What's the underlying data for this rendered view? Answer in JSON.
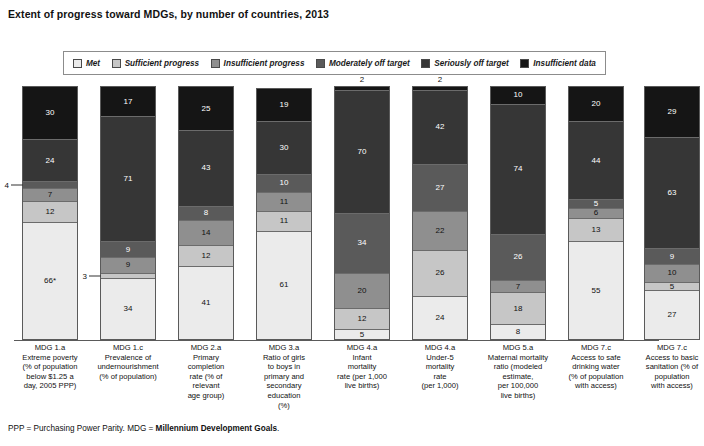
{
  "title": "Extent of progress toward MDGs, by number of countries, 2013",
  "footnote": {
    "prefix": "PPP = Purchasing Power Parity. MDG = ",
    "bold": "Millennium Development Goals",
    "suffix": "."
  },
  "legend": {
    "items": [
      {
        "label": "Met",
        "color": "#ebebeb"
      },
      {
        "label": "Sufficient progress",
        "color": "#c6c6c6"
      },
      {
        "label": "Insufficient progress",
        "color": "#8f8f8f"
      },
      {
        "label": "Moderately off target",
        "color": "#5a5a5a"
      },
      {
        "label": "Seriously off target",
        "color": "#363636"
      },
      {
        "label": "Insufficient data",
        "color": "#151515"
      }
    ]
  },
  "chart_data": {
    "type": "bar",
    "subtype": "stacked-vertical",
    "title": "Extent of progress toward MDGs, by number of countries, 2013",
    "xlabel": "",
    "ylabel": "Number of countries",
    "grid": false,
    "legend_position": "top",
    "series": [
      {
        "name": "Met",
        "color": "#ebebeb",
        "values": [
          66,
          34,
          41,
          61,
          5,
          24,
          8,
          55,
          27
        ]
      },
      {
        "name": "Sufficient progress",
        "color": "#c6c6c6",
        "values": [
          12,
          3,
          12,
          11,
          12,
          26,
          18,
          13,
          5
        ]
      },
      {
        "name": "Insufficient progress",
        "color": "#8f8f8f",
        "values": [
          7,
          9,
          14,
          11,
          20,
          22,
          7,
          6,
          10
        ]
      },
      {
        "name": "Moderately off target",
        "color": "#5a5a5a",
        "values": [
          4,
          9,
          8,
          10,
          34,
          27,
          26,
          5,
          9
        ]
      },
      {
        "name": "Seriously off target",
        "color": "#363636",
        "values": [
          24,
          71,
          43,
          30,
          70,
          42,
          74,
          44,
          63
        ]
      },
      {
        "name": "Insufficient data",
        "color": "#151515",
        "values": [
          30,
          17,
          25,
          19,
          2,
          2,
          10,
          20,
          29
        ]
      }
    ],
    "categories": [
      "MDG 1.a Extreme poverty (% of population below $1.25 a day, 2005 PPP)",
      "MDG 1.c Prevalence of undernourishment (% of population)",
      "MDG 2.a Primary completion rate (% of relevant age group)",
      "MDG 3.a Ratio of girls to boys in primary and secondary education (%)",
      "MDG 4.a Infant mortality rate (per 1,000 live births)",
      "MDG 4.a Under-5 mortality rate (per 1,000)",
      "MDG 5.a Maternal mortality ratio (modeled estimate, per 100,000 live births)",
      "MDG 7.c Access to safe drinking water (% of population with access)",
      "MDG 7.c Access to basic sanitation (% of population with access)"
    ]
  },
  "bars": [
    {
      "id": "mdg-1a",
      "x": 22,
      "above_label": "",
      "total": 143,
      "label_lines": [
        "MDG 1.a",
        "Extreme poverty",
        "(% of population",
        "below $1.25 a",
        "day, 2005 PPP)"
      ],
      "segments": [
        {
          "name": "Insufficient data",
          "value": 30,
          "display": "30",
          "color": "#151515",
          "text": "light",
          "mode": "inside"
        },
        {
          "name": "Seriously off target",
          "value": 24,
          "display": "24",
          "color": "#363636",
          "text": "light",
          "mode": "inside"
        },
        {
          "name": "Moderately off target",
          "value": 4,
          "display": "4",
          "color": "#5a5a5a",
          "text": "dark",
          "mode": "callout"
        },
        {
          "name": "Insufficient progress",
          "value": 7,
          "display": "7",
          "color": "#8f8f8f",
          "text": "dark",
          "mode": "inside"
        },
        {
          "name": "Sufficient progress",
          "value": 12,
          "display": "12",
          "color": "#c6c6c6",
          "text": "dark",
          "mode": "inside"
        },
        {
          "name": "Met",
          "value": 66,
          "display": "66*",
          "color": "#ebebeb",
          "text": "dark",
          "mode": "inside"
        }
      ]
    },
    {
      "id": "mdg-1c",
      "x": 100,
      "above_label": "",
      "total": 143,
      "label_lines": [
        "MDG 1.c",
        "Prevalence of",
        "undernourishment",
        "(% of population)"
      ],
      "segments": [
        {
          "name": "Insufficient data",
          "value": 17,
          "display": "17",
          "color": "#151515",
          "text": "light",
          "mode": "inside"
        },
        {
          "name": "Seriously off target",
          "value": 71,
          "display": "71",
          "color": "#363636",
          "text": "light",
          "mode": "inside"
        },
        {
          "name": "Moderately off target",
          "value": 9,
          "display": "9",
          "color": "#5a5a5a",
          "text": "light",
          "mode": "inside"
        },
        {
          "name": "Insufficient progress",
          "value": 9,
          "display": "9",
          "color": "#8f8f8f",
          "text": "dark",
          "mode": "inside"
        },
        {
          "name": "Sufficient progress",
          "value": 3,
          "display": "3",
          "color": "#c6c6c6",
          "text": "dark",
          "mode": "callout"
        },
        {
          "name": "Met",
          "value": 34,
          "display": "34",
          "color": "#ebebeb",
          "text": "dark",
          "mode": "inside"
        }
      ]
    },
    {
      "id": "mdg-2a",
      "x": 178,
      "above_label": "",
      "total": 143,
      "label_lines": [
        "MDG 2.a",
        "Primary",
        "completion",
        "rate (% of",
        "relevant",
        "age group)"
      ],
      "segments": [
        {
          "name": "Insufficient data",
          "value": 25,
          "display": "25",
          "color": "#151515",
          "text": "light",
          "mode": "inside"
        },
        {
          "name": "Seriously off target",
          "value": 43,
          "display": "43",
          "color": "#363636",
          "text": "light",
          "mode": "inside"
        },
        {
          "name": "Moderately off target",
          "value": 8,
          "display": "8",
          "color": "#5a5a5a",
          "text": "light",
          "mode": "inside"
        },
        {
          "name": "Insufficient progress",
          "value": 14,
          "display": "14",
          "color": "#8f8f8f",
          "text": "dark",
          "mode": "inside"
        },
        {
          "name": "Sufficient progress",
          "value": 12,
          "display": "12",
          "color": "#c6c6c6",
          "text": "dark",
          "mode": "inside"
        },
        {
          "name": "Met",
          "value": 41,
          "display": "41",
          "color": "#ebebeb",
          "text": "dark",
          "mode": "inside"
        }
      ]
    },
    {
      "id": "mdg-3a",
      "x": 256,
      "above_label": "",
      "total": 142,
      "label_lines": [
        "MDG 3.a",
        "Ratio of girls",
        "to boys in",
        "primary and",
        "secondary",
        "education",
        "(%)"
      ],
      "segments": [
        {
          "name": "Insufficient data",
          "value": 19,
          "display": "19",
          "color": "#151515",
          "text": "light",
          "mode": "inside"
        },
        {
          "name": "Seriously off target",
          "value": 30,
          "display": "30",
          "color": "#363636",
          "text": "light",
          "mode": "inside"
        },
        {
          "name": "Moderately off target",
          "value": 10,
          "display": "10",
          "color": "#5a5a5a",
          "text": "light",
          "mode": "inside"
        },
        {
          "name": "Insufficient progress",
          "value": 11,
          "display": "11",
          "color": "#8f8f8f",
          "text": "dark",
          "mode": "inside"
        },
        {
          "name": "Sufficient progress",
          "value": 11,
          "display": "11",
          "color": "#c6c6c6",
          "text": "dark",
          "mode": "inside"
        },
        {
          "name": "Met",
          "value": 61,
          "display": "61",
          "color": "#ebebeb",
          "text": "dark",
          "mode": "inside"
        }
      ]
    },
    {
      "id": "mdg-4a-infant",
      "x": 334,
      "above_label": "2",
      "total": 143,
      "label_lines": [
        "MDG 4.a",
        "Infant",
        "mortality",
        "rate (per 1,000",
        "live births)"
      ],
      "segments": [
        {
          "name": "Insufficient data",
          "value": 2,
          "display": "2",
          "color": "#151515",
          "text": "light",
          "mode": "above"
        },
        {
          "name": "Seriously off target",
          "value": 70,
          "display": "70",
          "color": "#363636",
          "text": "light",
          "mode": "inside"
        },
        {
          "name": "Moderately off target",
          "value": 34,
          "display": "34",
          "color": "#5a5a5a",
          "text": "light",
          "mode": "inside"
        },
        {
          "name": "Insufficient progress",
          "value": 20,
          "display": "20",
          "color": "#8f8f8f",
          "text": "dark",
          "mode": "inside"
        },
        {
          "name": "Sufficient progress",
          "value": 12,
          "display": "12",
          "color": "#c6c6c6",
          "text": "dark",
          "mode": "inside"
        },
        {
          "name": "Met",
          "value": 5,
          "display": "5",
          "color": "#ebebeb",
          "text": "dark",
          "mode": "inside"
        }
      ]
    },
    {
      "id": "mdg-4a-under5",
      "x": 412,
      "above_label": "2",
      "total": 143,
      "label_lines": [
        "MDG 4.a",
        "Under-5",
        "mortality",
        "rate",
        "(per 1,000)"
      ],
      "segments": [
        {
          "name": "Insufficient data",
          "value": 2,
          "display": "2",
          "color": "#151515",
          "text": "light",
          "mode": "above"
        },
        {
          "name": "Seriously off target",
          "value": 42,
          "display": "42",
          "color": "#363636",
          "text": "light",
          "mode": "inside"
        },
        {
          "name": "Moderately off target",
          "value": 27,
          "display": "27",
          "color": "#5a5a5a",
          "text": "light",
          "mode": "inside"
        },
        {
          "name": "Insufficient progress",
          "value": 22,
          "display": "22",
          "color": "#8f8f8f",
          "text": "dark",
          "mode": "inside"
        },
        {
          "name": "Sufficient progress",
          "value": 26,
          "display": "26",
          "color": "#c6c6c6",
          "text": "dark",
          "mode": "inside"
        },
        {
          "name": "Met",
          "value": 24,
          "display": "24",
          "color": "#ebebeb",
          "text": "dark",
          "mode": "inside"
        }
      ]
    },
    {
      "id": "mdg-5a",
      "x": 490,
      "above_label": "",
      "total": 143,
      "label_lines": [
        "MDG 5.a",
        "Maternal mortality",
        "ratio (modeled",
        "estimate,",
        "per 100,000",
        "live births)"
      ],
      "segments": [
        {
          "name": "Insufficient data",
          "value": 10,
          "display": "10",
          "color": "#151515",
          "text": "light",
          "mode": "inside"
        },
        {
          "name": "Seriously off target",
          "value": 74,
          "display": "74",
          "color": "#363636",
          "text": "light",
          "mode": "inside"
        },
        {
          "name": "Moderately off target",
          "value": 26,
          "display": "26",
          "color": "#5a5a5a",
          "text": "light",
          "mode": "inside"
        },
        {
          "name": "Insufficient progress",
          "value": 7,
          "display": "7",
          "color": "#8f8f8f",
          "text": "dark",
          "mode": "inside"
        },
        {
          "name": "Sufficient progress",
          "value": 18,
          "display": "18",
          "color": "#c6c6c6",
          "text": "dark",
          "mode": "inside"
        },
        {
          "name": "Met",
          "value": 8,
          "display": "8",
          "color": "#ebebeb",
          "text": "dark",
          "mode": "inside"
        }
      ]
    },
    {
      "id": "mdg-7c-water",
      "x": 568,
      "above_label": "",
      "total": 143,
      "label_lines": [
        "MDG 7.c",
        "Access to safe",
        "drinking water",
        "(% of population",
        "with access)"
      ],
      "segments": [
        {
          "name": "Insufficient data",
          "value": 20,
          "display": "20",
          "color": "#151515",
          "text": "light",
          "mode": "inside"
        },
        {
          "name": "Seriously off target",
          "value": 44,
          "display": "44",
          "color": "#363636",
          "text": "light",
          "mode": "inside"
        },
        {
          "name": "Moderately off target",
          "value": 5,
          "display": "5",
          "color": "#5a5a5a",
          "text": "light",
          "mode": "inside"
        },
        {
          "name": "Insufficient progress",
          "value": 6,
          "display": "6",
          "color": "#8f8f8f",
          "text": "dark",
          "mode": "inside"
        },
        {
          "name": "Sufficient progress",
          "value": 13,
          "display": "13",
          "color": "#c6c6c6",
          "text": "dark",
          "mode": "inside"
        },
        {
          "name": "Met",
          "value": 55,
          "display": "55",
          "color": "#ebebeb",
          "text": "dark",
          "mode": "inside"
        }
      ]
    },
    {
      "id": "mdg-7c-sanitation",
      "x": 644,
      "above_label": "",
      "total": 143,
      "label_lines": [
        "MDG 7.c",
        "Access to basic",
        "sanitation (% of",
        "population",
        "with access)"
      ],
      "segments": [
        {
          "name": "Insufficient data",
          "value": 29,
          "display": "29",
          "color": "#151515",
          "text": "light",
          "mode": "inside"
        },
        {
          "name": "Seriously off target",
          "value": 63,
          "display": "63",
          "color": "#363636",
          "text": "light",
          "mode": "inside"
        },
        {
          "name": "Moderately off target",
          "value": 9,
          "display": "9",
          "color": "#5a5a5a",
          "text": "light",
          "mode": "inside"
        },
        {
          "name": "Insufficient progress",
          "value": 10,
          "display": "10",
          "color": "#8f8f8f",
          "text": "dark",
          "mode": "inside"
        },
        {
          "name": "Sufficient progress",
          "value": 5,
          "display": "5",
          "color": "#c6c6c6",
          "text": "dark",
          "mode": "inside"
        },
        {
          "name": "Met",
          "value": 27,
          "display": "27",
          "color": "#ebebeb",
          "text": "dark",
          "mode": "inside"
        }
      ]
    }
  ]
}
